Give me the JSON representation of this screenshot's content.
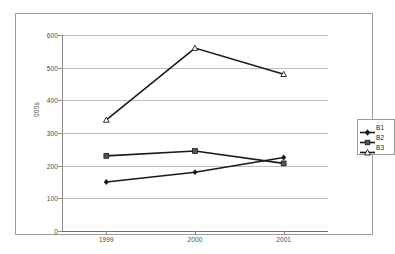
{
  "chart_data": {
    "type": "line",
    "title": "",
    "xlabel": "",
    "ylabel": "000s",
    "categories": [
      "1999",
      "2000",
      "2001"
    ],
    "ylim": [
      0,
      600
    ],
    "yticks": [
      0,
      100,
      200,
      300,
      400,
      500,
      600
    ],
    "ytick_labels": [
      "0",
      "100",
      "200",
      "300",
      "400",
      "500",
      "600"
    ],
    "grid": true,
    "legend_position": "right",
    "series": [
      {
        "name": "B1",
        "values": [
          150,
          180,
          225
        ],
        "marker": "diamond",
        "color": "#1a1a1a"
      },
      {
        "name": "B2",
        "values": [
          230,
          245,
          207
        ],
        "marker": "square",
        "color": "#1a1a1a"
      },
      {
        "name": "B3",
        "values": [
          340,
          560,
          480
        ],
        "marker": "triangle-open",
        "color": "#1a1a1a"
      }
    ]
  },
  "axes": {
    "y_title": "000s",
    "y_tick_0": "0",
    "y_tick_1": "100",
    "y_tick_2": "200",
    "y_tick_3": "300",
    "y_tick_4": "400",
    "y_tick_5": "500",
    "y_tick_6": "600",
    "x_tick_0": "1999",
    "x_tick_1": "2000",
    "x_tick_2": "2001"
  },
  "legend": {
    "items": [
      {
        "label": "B1"
      },
      {
        "label": "B2"
      },
      {
        "label": "B3"
      }
    ]
  },
  "colors": {
    "line": "#1a1a1a",
    "gridline": "#bfbfbf",
    "axis": "#8a8a8a",
    "frame": "#9b9b9b",
    "text": "#4a4a4a"
  }
}
